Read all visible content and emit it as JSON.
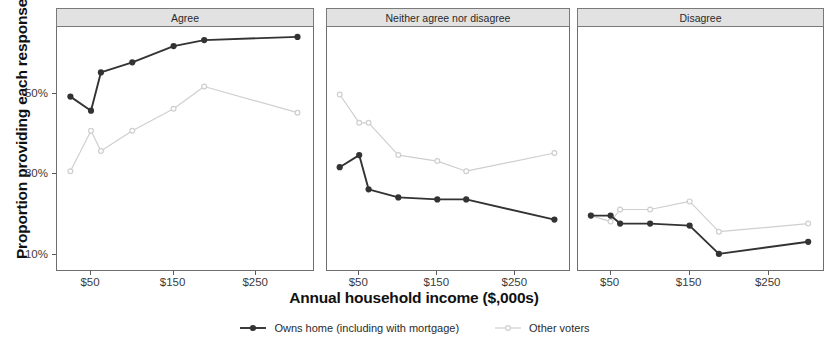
{
  "chart_data": {
    "type": "line",
    "title": "",
    "xlabel": "Annual household income ($,000s)",
    "ylabel": "Proportion providing each response",
    "xlim": [
      10,
      320
    ],
    "ylim": [
      6,
      66
    ],
    "grid": false,
    "legend_position": "bottom",
    "y_ticks": [
      {
        "value": 10,
        "label": "10%"
      },
      {
        "value": 30,
        "label": "30%"
      },
      {
        "value": 50,
        "label": "50%"
      }
    ],
    "x_ticks": [
      {
        "value": 50,
        "label": "$50"
      },
      {
        "value": 150,
        "label": "$150"
      },
      {
        "value": 250,
        "label": "$250"
      }
    ],
    "x": [
      25,
      50,
      62,
      100,
      150,
      187,
      300
    ],
    "facets": [
      {
        "label": "Agree",
        "series": [
          {
            "name": "Owns home (including with mortgage)",
            "color": "#333333",
            "values": [
              49.0,
              45.5,
              55.0,
              57.5,
              61.5,
              63.0,
              63.8
            ]
          },
          {
            "name": "Other voters",
            "color": "#cfcfcf",
            "values": [
              30.5,
              40.5,
              35.5,
              40.5,
              46.0,
              51.5,
              45.0
            ]
          }
        ]
      },
      {
        "label": "Neither agree nor disagree",
        "series": [
          {
            "name": "Owns home (including with mortgage)",
            "color": "#333333",
            "values": [
              31.5,
              34.5,
              26.0,
              24.0,
              23.5,
              23.5,
              18.5
            ]
          },
          {
            "name": "Other voters",
            "color": "#cfcfcf",
            "values": [
              49.5,
              42.5,
              42.5,
              34.5,
              33.0,
              30.5,
              35.0
            ]
          }
        ]
      },
      {
        "label": "Disagree",
        "series": [
          {
            "name": "Owns home (including with mortgage)",
            "color": "#333333",
            "values": [
              19.5,
              19.5,
              17.5,
              17.5,
              17.0,
              10.0,
              13.0
            ]
          },
          {
            "name": "Other voters",
            "color": "#cfcfcf",
            "values": [
              19.5,
              18.0,
              21.0,
              21.0,
              23.0,
              15.5,
              17.5
            ]
          }
        ]
      }
    ],
    "legend": [
      {
        "label": "Owns home (including with mortgage)",
        "color": "#333333",
        "marker": "filled-circle"
      },
      {
        "label": "Other voters",
        "color": "#cfcfcf",
        "marker": "open-circle"
      }
    ]
  },
  "axis": {
    "y_title": "Proportion providing each response",
    "x_title": "Annual household income ($,000s)"
  }
}
